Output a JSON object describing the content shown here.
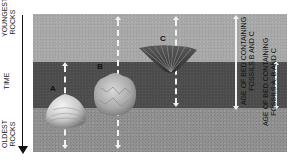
{
  "axis": {
    "top_label": "YOUNGEST ROCKS",
    "top_label_line1": "YOUNGEST",
    "top_label_line2": "ROCKS",
    "middle_label": "TIME",
    "bottom_label": "OLDEST ROCKS",
    "bottom_label_line1": "OLDEST",
    "bottom_label_line2": "ROCKS",
    "direction": "down"
  },
  "layers": [
    {
      "name": "upper rock layer",
      "color": "#a8a8a8"
    },
    {
      "name": "bed containing fossils A, B and C",
      "color": "#4c4c4c"
    },
    {
      "name": "lower rock layer",
      "color": "#8f8f8f"
    }
  ],
  "fossils": [
    {
      "label": "A",
      "type": "clam shell",
      "range": "middle and lower layers"
    },
    {
      "label": "B",
      "type": "rounded shell",
      "range": "all layers"
    },
    {
      "label": "C",
      "type": "fan-shaped shell",
      "range": "upper and middle layers"
    }
  ],
  "ranges": [
    {
      "label": "AGE OF BED CONTAINING FOSSILS B AND C",
      "line1": "AGE OF BED CONTAINING",
      "line2": "FOSSILS B AND C"
    },
    {
      "label": "AGE OF BED CONTAINING FOSSILS A, B AND C",
      "line1": "AGE OF BED CONTAINING",
      "line2": "FOSSILS A, B AND C"
    }
  ]
}
